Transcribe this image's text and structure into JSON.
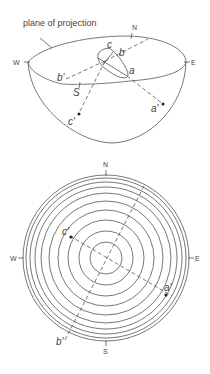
{
  "figure": {
    "top_panel": {
      "caption_label": "plane of projection",
      "compass": {
        "north": "N",
        "south": "S",
        "west": "W",
        "east": "E"
      },
      "points": {
        "a": "a",
        "b": "b",
        "c": "c",
        "a_prime": "a'",
        "b_prime": "b'",
        "c_prime": "c'"
      }
    },
    "bottom_panel": {
      "compass": {
        "north": "N",
        "south": "S",
        "west": "W",
        "east": "E"
      },
      "points": {
        "a_prime": "a'",
        "b_prime": "b'",
        "c_prime": "c'"
      },
      "concentric_circle_radii": [
        16,
        27,
        38,
        48,
        57,
        65,
        71,
        76,
        80,
        83
      ]
    }
  }
}
